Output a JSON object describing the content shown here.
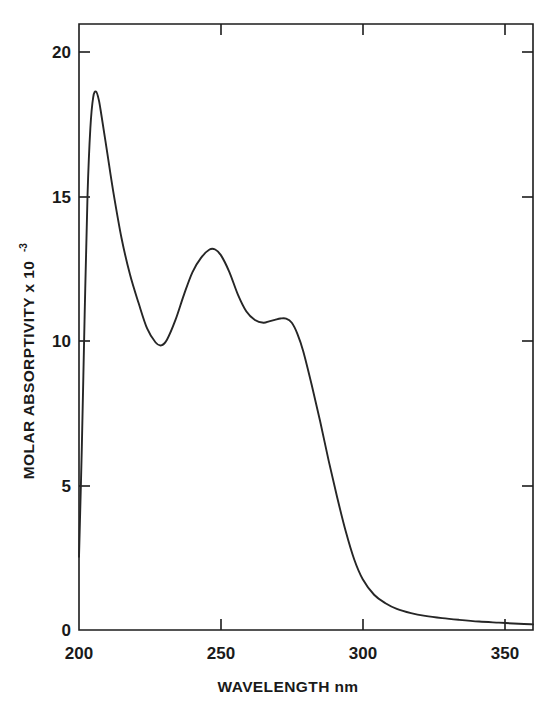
{
  "chart_data": {
    "type": "line",
    "title": "",
    "xlabel": "WAVELENGTH nm",
    "ylabel": "MOLAR ABSORPTIVITY x 10",
    "ylabel_exponent": "-3",
    "xlim": [
      200,
      360
    ],
    "ylim": [
      0,
      21.5
    ],
    "grid": false,
    "legend": "none",
    "xticks": [
      200,
      250,
      300,
      350
    ],
    "xtick_labels": [
      "200",
      "250",
      "300",
      "350"
    ],
    "yticks": [
      0,
      5,
      10,
      15,
      20
    ],
    "ytick_labels": [
      "0",
      "5",
      "10",
      "15",
      "20"
    ],
    "series": [
      {
        "name": "molar absorptivity spectrum",
        "x": [
          200,
          201,
          202,
          203,
          204,
          205,
          206,
          207,
          208,
          210,
          212,
          215,
          218,
          221,
          224,
          227,
          229,
          231,
          234,
          237,
          240,
          243,
          246,
          248,
          250,
          253,
          256,
          259,
          262,
          265,
          267,
          269,
          271,
          273,
          275,
          277,
          279,
          282,
          285,
          288,
          291,
          294,
          297,
          300,
          304,
          308,
          312,
          317,
          322,
          328,
          334,
          341,
          348,
          355,
          360
        ],
        "y": [
          2.6,
          6.5,
          11.2,
          15.4,
          17.8,
          18.9,
          19.1,
          18.8,
          18.2,
          16.9,
          15.6,
          13.9,
          12.6,
          11.6,
          10.7,
          10.2,
          10.1,
          10.3,
          11.0,
          11.9,
          12.7,
          13.2,
          13.5,
          13.5,
          13.3,
          12.7,
          11.9,
          11.3,
          11.0,
          10.9,
          10.95,
          11.0,
          11.05,
          11.05,
          10.9,
          10.5,
          9.9,
          8.7,
          7.4,
          6.0,
          4.7,
          3.5,
          2.5,
          1.8,
          1.25,
          0.95,
          0.75,
          0.6,
          0.5,
          0.42,
          0.36,
          0.3,
          0.26,
          0.22,
          0.2
        ]
      }
    ],
    "annotations": {
      "peak_1": {
        "x": 206,
        "y": 19.1
      },
      "valley_1": {
        "x": 229,
        "y": 10.1
      },
      "peak_2": {
        "x": 247,
        "y": 13.5
      },
      "shoulder": {
        "x": 272,
        "y": 11.05
      }
    }
  }
}
